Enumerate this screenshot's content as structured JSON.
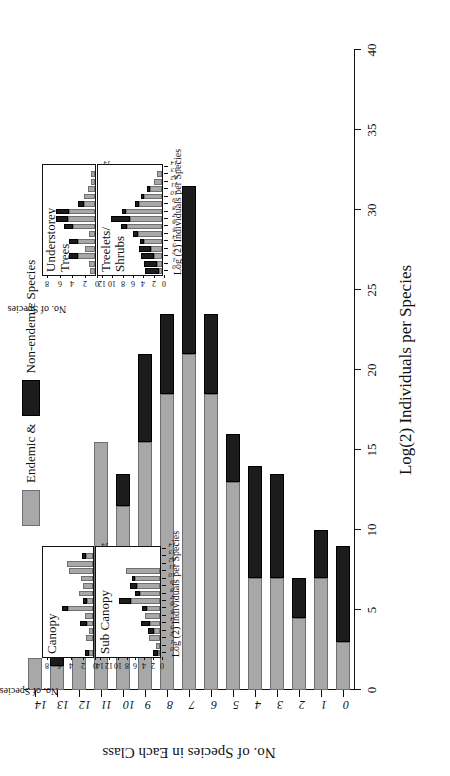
{
  "figure": {
    "rotation_note": "page rendered sideways",
    "colors": {
      "endemic": "#a8a8a8",
      "non_endemic": "#1c1c1c",
      "axis": "#111111"
    }
  },
  "legend": {
    "endemic_label": "Endemic &",
    "non_endemic_label": "Non-endemic Species"
  },
  "chart_data": [
    {
      "id": "main",
      "type": "bar",
      "stacked": true,
      "title": "",
      "xlabel": "Log(2) Individuals per Species",
      "ylabel": "No. of Species in Each Class",
      "categories": [
        "0",
        "1",
        "2",
        "3",
        "4",
        "5",
        "6",
        "7",
        "8",
        "9",
        "10",
        "11",
        "12",
        "13",
        "14"
      ],
      "ylim": [
        0,
        40
      ],
      "yticks": [
        0,
        5,
        10,
        15,
        20,
        25,
        30,
        35,
        40
      ],
      "grid": false,
      "legend_position": "top-center",
      "series": [
        {
          "name": "Endemic &",
          "values": [
            3,
            7,
            4.5,
            7,
            7,
            13,
            18.5,
            21,
            18.5,
            15.5,
            11.5,
            15.5,
            6,
            1.5,
            2
          ]
        },
        {
          "name": "Non-endemic Species",
          "values": [
            6,
            3,
            2.5,
            6.5,
            7,
            3,
            5,
            10.5,
            5,
            5.5,
            2,
            0,
            0,
            1.5,
            0
          ]
        }
      ],
      "totals": [
        9,
        10,
        7,
        13.5,
        14,
        16,
        23.5,
        31.5,
        23.5,
        21,
        13.5,
        15.5,
        6,
        3,
        2
      ]
    },
    {
      "id": "canopy",
      "type": "bar",
      "stacked": true,
      "title": "Canopy",
      "xlabel": "",
      "ylabel": "No. of Species",
      "categories": [
        "0",
        "1",
        "2",
        "3",
        "4",
        "5",
        "6",
        "7",
        "8",
        "9",
        "10",
        "11",
        "12",
        "13",
        "14"
      ],
      "ylim": [
        0,
        8
      ],
      "yticks": [
        0,
        2,
        4,
        6,
        8
      ],
      "grid": false,
      "series": [
        {
          "name": "Endemic &",
          "values": [
            0.6,
            0,
            1.1,
            0.7,
            1.0,
            1.3,
            4.2,
            1.0,
            2.4,
            1.6,
            2.0,
            4.0,
            4.3,
            1.2,
            0
          ]
        },
        {
          "name": "Non-endemic Species",
          "values": [
            0.8,
            0,
            0,
            0,
            1.2,
            0,
            0.9,
            0.6,
            0,
            0,
            0,
            0,
            0,
            0.7,
            0
          ]
        }
      ]
    },
    {
      "id": "sub-canopy",
      "type": "bar",
      "stacked": true,
      "title": "Sub Canopy",
      "xlabel": "Log (2) Individuals per Species",
      "ylabel": "No. of Species",
      "categories": [
        "0",
        "1",
        "2",
        "3",
        "4",
        "5",
        "6",
        "7",
        "8",
        "9",
        "10",
        "11",
        "12",
        "13",
        "14"
      ],
      "ylim": [
        0,
        14
      ],
      "yticks": [
        0,
        2,
        4,
        6,
        8,
        10,
        12,
        14
      ],
      "grid": false,
      "series": [
        {
          "name": "Endemic &",
          "values": [
            0.4,
            0.9,
            2.4,
            1.3,
            2.2,
            3.3,
            3.0,
            6.6,
            4.5,
            5.3,
            5.6,
            7.6,
            0,
            0,
            0
          ]
        },
        {
          "name": "Non-endemic Species",
          "values": [
            1.2,
            0,
            0,
            1.4,
            2.0,
            0,
            1.0,
            2.6,
            1.2,
            1.4,
            0.8,
            0,
            0,
            0,
            0
          ]
        }
      ]
    },
    {
      "id": "understorey-trees",
      "type": "bar",
      "stacked": true,
      "title": "Understorey\nTrees",
      "xlabel": "",
      "ylabel": "No. of Species",
      "categories": [
        "0",
        "1",
        "2",
        "3",
        "4",
        "5",
        "6",
        "7",
        "8",
        "9",
        "10",
        "11",
        "12",
        "13",
        "14"
      ],
      "ylim": [
        0,
        8
      ],
      "yticks": [
        0,
        2,
        4,
        6,
        8
      ],
      "grid": false,
      "series": [
        {
          "name": "Endemic &",
          "values": [
            0.8,
            1.0,
            2.7,
            1.6,
            2.8,
            1.0,
            3.6,
            4.4,
            4.2,
            1.8,
            1.8,
            1.2,
            0.6,
            0.6,
            0
          ]
        },
        {
          "name": "Non-endemic Species",
          "values": [
            0,
            0,
            1.5,
            0,
            1.4,
            0,
            1.4,
            1.9,
            2.0,
            0.9,
            0,
            0,
            0,
            0,
            0
          ]
        }
      ]
    },
    {
      "id": "treelets-shrubs",
      "type": "bar",
      "stacked": true,
      "title": "Treelets/\nShrubs",
      "xlabel": "Log (2) Individuals per Species",
      "ylabel": "No. of Species",
      "categories": [
        "0",
        "1",
        "2",
        "3",
        "4",
        "5",
        "6",
        "7",
        "8",
        "9",
        "10",
        "11",
        "12",
        "13",
        "14"
      ],
      "ylim": [
        0,
        12
      ],
      "yticks": [
        0,
        2,
        4,
        6,
        8,
        10,
        12
      ],
      "grid": false,
      "series": [
        {
          "name": "Endemic &",
          "values": [
            0.6,
            1.0,
            1.6,
            2.2,
            3.4,
            4.6,
            6.8,
            6.2,
            7.0,
            4.5,
            3.4,
            2.4,
            1.6,
            0.9,
            0
          ]
        },
        {
          "name": "Non-endemic Species",
          "values": [
            2.6,
            2.4,
            2.4,
            2.2,
            0.8,
            1.0,
            1.2,
            3.6,
            0.8,
            0.7,
            0.7,
            0.5,
            0,
            0,
            0
          ]
        }
      ]
    }
  ],
  "axis_titles": {
    "main_x": "Log(2) Individuals per Species",
    "main_y": "No. of Species in Each Class",
    "inset_left_x": "Log (2) Individuals per Species",
    "inset_left_y": "No. of Species",
    "inset_right_x": "Log (2) Individuals per Species",
    "inset_right_y": "No. of Species"
  }
}
